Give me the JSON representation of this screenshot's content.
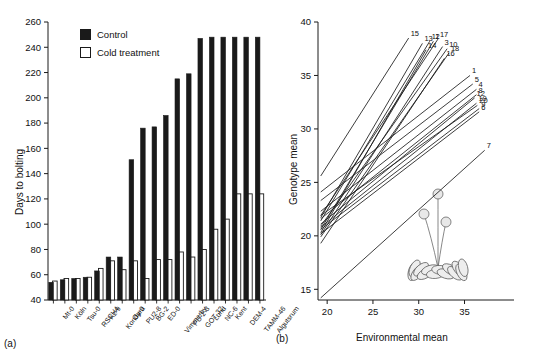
{
  "figure": {
    "panel_a_label": "(a)",
    "panel_b_label": "(b)"
  },
  "panel_a": {
    "ylabel": "Days to bolting",
    "legend": [
      {
        "key": "control",
        "label": "Control",
        "swatch": "filled-black-square"
      },
      {
        "key": "cold",
        "label": "Cold treatment",
        "swatch": "open-white-square"
      }
    ],
    "yticks": [
      40,
      60,
      80,
      100,
      120,
      140,
      160,
      180,
      200,
      220,
      240,
      260
    ]
  },
  "panel_b": {
    "xlabel": "Environmental mean",
    "ylabel": "Genotype mean",
    "xticks": [
      20,
      25,
      30,
      35
    ],
    "yticks": [
      15,
      20,
      25,
      30,
      35,
      40
    ],
    "plant_illustration": "arabidopsis-rosette-with-inflorescences"
  },
  "chart_data": [
    {
      "type": "bar",
      "title": "",
      "xlabel": "",
      "ylabel": "Days to bolting",
      "ylim": [
        40,
        260
      ],
      "ytick_step": 20,
      "grid": false,
      "legend_position": "top-left",
      "categories": [
        "Mt-0",
        "Köln",
        "Tsu-0",
        "RSCH4",
        "Kz-9",
        "Kondara",
        "Oy-0",
        "PU2-8",
        "BG-2",
        "ED-0",
        "Vimmerby",
        "PU-2-3",
        "GOT-32",
        "Lund",
        "NC-6",
        "Kent",
        "DEM-4",
        "TAMM-46",
        "Algutsrum"
      ],
      "series": [
        {
          "name": "Control",
          "values": [
            54,
            56,
            57,
            58,
            63,
            74,
            74,
            151,
            176,
            177,
            186,
            215,
            219,
            247,
            248,
            248,
            248,
            248,
            248
          ]
        },
        {
          "name": "Cold treatment",
          "values": [
            55,
            57,
            57,
            58,
            65,
            71,
            64,
            71,
            57,
            72,
            72,
            78,
            74,
            80,
            96,
            104,
            124,
            124,
            124
          ]
        }
      ]
    },
    {
      "type": "line",
      "title": "",
      "xlabel": "Environmental mean",
      "ylabel": "Genotype mean",
      "xlim": [
        19,
        38
      ],
      "ylim": [
        14,
        40
      ],
      "xtick_step": 5,
      "ytick_step": 5,
      "grid": false,
      "legend_position": "inline-line-end-labels",
      "description": "Reaction norms: 20 genotype regression lines of genotype mean on environmental mean",
      "series": [
        {
          "name": "1",
          "x": [
            19.3,
            35.6
          ],
          "y": [
            24.1,
            35.0
          ]
        },
        {
          "name": "2",
          "x": [
            19.3,
            31.6
          ],
          "y": [
            20.6,
            38.2
          ]
        },
        {
          "name": "3",
          "x": [
            19.3,
            32.6
          ],
          "y": [
            20.1,
            37.7
          ]
        },
        {
          "name": "4",
          "x": [
            19.3,
            36.3
          ],
          "y": [
            22.3,
            33.7
          ]
        },
        {
          "name": "5",
          "x": [
            19.3,
            35.9
          ],
          "y": [
            23.3,
            34.2
          ]
        },
        {
          "name": "6",
          "x": [
            19.3,
            36.6
          ],
          "y": [
            20.2,
            31.6
          ]
        },
        {
          "name": "7",
          "x": [
            19.3,
            37.2
          ],
          "y": [
            14.2,
            28.0
          ]
        },
        {
          "name": "8",
          "x": [
            19.3,
            36.3
          ],
          "y": [
            21.6,
            33.2
          ]
        },
        {
          "name": "9",
          "x": [
            19.3,
            36.6
          ],
          "y": [
            20.6,
            31.9
          ]
        },
        {
          "name": "10",
          "x": [
            19.3,
            33.1
          ],
          "y": [
            20.9,
            37.5
          ]
        },
        {
          "name": "11",
          "x": [
            19.3,
            31.2
          ],
          "y": [
            21.4,
            38.2
          ]
        },
        {
          "name": "12",
          "x": [
            19.3,
            36.1
          ],
          "y": [
            21.1,
            32.9
          ]
        },
        {
          "name": "13",
          "x": [
            19.3,
            30.4
          ],
          "y": [
            21.7,
            38.0
          ]
        },
        {
          "name": "14",
          "x": [
            19.3,
            30.8
          ],
          "y": [
            20.3,
            37.4
          ]
        },
        {
          "name": "15",
          "x": [
            19.3,
            28.9
          ],
          "y": [
            25.6,
            38.5
          ]
        },
        {
          "name": "16",
          "x": [
            19.3,
            32.8
          ],
          "y": [
            19.3,
            36.6
          ]
        },
        {
          "name": "17",
          "x": [
            19.3,
            32.1
          ],
          "y": [
            21.9,
            38.4
          ]
        },
        {
          "name": "18",
          "x": [
            19.3,
            33.3
          ],
          "y": [
            19.9,
            37.1
          ]
        },
        {
          "name": "19",
          "x": [
            19.3,
            36.3
          ],
          "y": [
            20.8,
            32.4
          ]
        },
        {
          "name": "20",
          "x": [
            19.3,
            36.4
          ],
          "y": [
            21.9,
            32.2
          ]
        }
      ],
      "end_labels": [
        "15",
        "13",
        "14",
        "11",
        "2",
        "17",
        "3",
        "10",
        "18",
        "16",
        "1",
        "5",
        "4",
        "8",
        "12",
        "19",
        "20",
        "9",
        "6",
        "7"
      ]
    }
  ]
}
